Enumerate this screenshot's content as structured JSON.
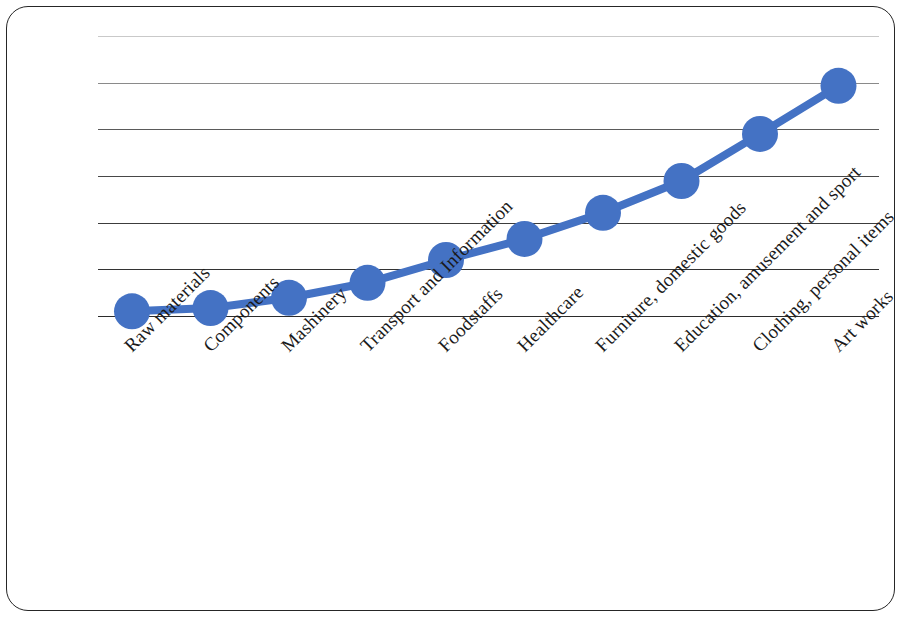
{
  "chart_data": {
    "type": "line",
    "title": "",
    "subtitle": "",
    "xlabel": "",
    "ylabel": "",
    "grid": true,
    "legend": null,
    "marker": "circle",
    "series_color": "#4472C4",
    "line_color": "#4472C4",
    "ylim": [
      0,
      6
    ],
    "y_tick_values": [
      0,
      1,
      2,
      3,
      4,
      5,
      6
    ],
    "y_tick_labels": [
      "",
      "",
      "",
      "",
      "",
      "",
      ""
    ],
    "categories": [
      "Raw materials",
      "Components",
      "Mashinery",
      "Transport and Information",
      "Foodstaffs",
      "Healthcare",
      "Furniture, domestic goods",
      "Education, amusement and sport",
      "Clothing, personal items",
      "Art works"
    ],
    "values": [
      0.1,
      0.17,
      0.39,
      0.71,
      1.2,
      1.65,
      2.21,
      2.89,
      3.9,
      4.93
    ],
    "series": [
      {
        "name": "value added",
        "values": [
          0.1,
          0.17,
          0.39,
          0.71,
          1.2,
          1.65,
          2.21,
          2.89,
          3.9,
          4.93
        ]
      }
    ]
  },
  "frame": {
    "border_color": "#262626",
    "background": "#ffffff"
  },
  "gridlines": [
    {
      "value": 6,
      "color": "#c9c9c9",
      "width": 1.0
    },
    {
      "value": 5,
      "color": "#8a8a8a",
      "width": 1.2
    },
    {
      "value": 4,
      "color": "#5a5a5a",
      "width": 1.4
    },
    {
      "value": 3,
      "color": "#484848",
      "width": 1.6
    },
    {
      "value": 2,
      "color": "#3c3c3c",
      "width": 1.6
    },
    {
      "value": 1,
      "color": "#333333",
      "width": 1.6
    },
    {
      "value": 0,
      "color": "#2b2b2b",
      "width": 1.8
    }
  ],
  "geometry": {
    "grid_left": 91,
    "grid_right": 872,
    "baseline_y": 309,
    "top_y": 29,
    "unit_px": 46.7,
    "marker_radius": 18,
    "line_width": 8,
    "first_point_x": 125,
    "point_spacing_x": 78.5,
    "label_font_size": 19,
    "label_rotation_deg": -45,
    "label_origin_y": 334
  }
}
